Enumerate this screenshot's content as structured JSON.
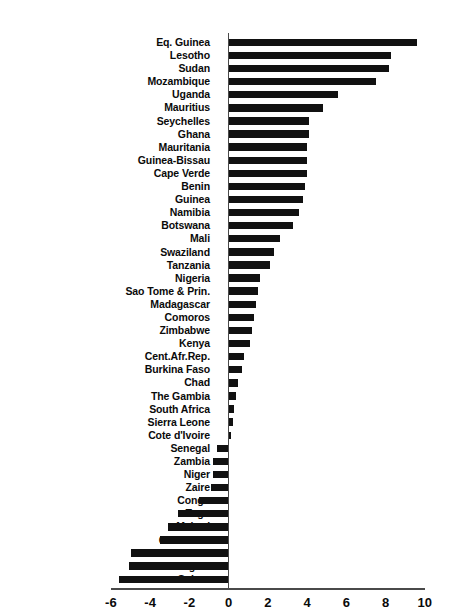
{
  "chart_data": {
    "type": "bar",
    "orientation": "horizontal",
    "title": "",
    "subtitle": "",
    "xlabel": "",
    "ylabel": "",
    "xlim": [
      -6,
      10
    ],
    "xticks": [
      -6,
      -4,
      -2,
      0,
      2,
      4,
      6,
      8,
      10
    ],
    "xtick_labels": [
      "-6",
      "-4",
      "-2",
      "0",
      "2",
      "4",
      "6",
      "8",
      "10"
    ],
    "grid": false,
    "legend": null,
    "bar_color": "#111111",
    "axis_color": "#4a4a4a",
    "zero_line": 0,
    "categories": [
      "Eq. Guinea",
      "Lesotho",
      "Sudan",
      "Mozambique",
      "Uganda",
      "Mauritius",
      "Seychelles",
      "Ghana",
      "Mauritania",
      "Guinea-Bissau",
      "Cape Verde",
      "Benin",
      "Guinea",
      "Namibia",
      "Botswana",
      "Mali",
      "Swaziland",
      "Tanzania",
      "Nigeria",
      "Sao Tome & Prin.",
      "Madagascar",
      "Comoros",
      "Zimbabwe",
      "Kenya",
      "Cent.Afr.Rep.",
      "Burkina Faso",
      "Chad",
      "The Gambia",
      "South Africa",
      "Sierra Leone",
      "Cote d'Ivoire",
      "Senegal",
      "Zambia",
      "Niger",
      "Zaire",
      "Congo",
      "Togo",
      "Malawi",
      "Cameroon",
      "Burundi",
      "Angola",
      "Gabon"
    ],
    "values": [
      9.6,
      8.3,
      8.2,
      7.5,
      5.6,
      4.8,
      4.1,
      4.1,
      4.0,
      4.0,
      4.0,
      3.9,
      3.8,
      3.6,
      3.3,
      2.6,
      2.3,
      2.1,
      1.6,
      1.5,
      1.4,
      1.3,
      1.2,
      1.1,
      0.8,
      0.7,
      0.5,
      0.4,
      0.3,
      0.2,
      0.1,
      -0.6,
      -0.8,
      -0.8,
      -0.9,
      -1.5,
      -2.6,
      -3.1,
      -3.5,
      -5.0,
      -5.1,
      -5.6
    ]
  }
}
